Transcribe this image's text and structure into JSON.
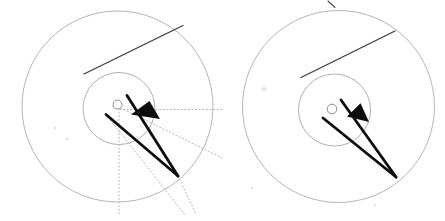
{
  "figure": {
    "width": 445,
    "height": 221,
    "background": "#ffffff",
    "colors": {
      "circle_stroke": "#b6b6b6",
      "inner_circle_stroke": "#b0b0b0",
      "hub_stroke": "#8f8f8f",
      "tangent_stroke": "#3c3c3c",
      "hand_stroke": "#0d0d0d",
      "arrowhead_fill": "#0d0d0d",
      "dotted_stroke": "#a9a9a9",
      "speck_color": "#c2c2c2",
      "tick_stroke": "#4a4a4a"
    },
    "stroke_widths": {
      "circle": 1,
      "inner_circle": 1,
      "hub": 1,
      "tangent": 1.3,
      "hand": 2.8,
      "dotted": 0.9,
      "tick": 1.1
    },
    "dotted_dash": "1 2.6",
    "panels": [
      {
        "name": "left-dial",
        "outer_circle": {
          "cx": 117.5,
          "cy": 106.5,
          "r": 95.5
        },
        "inner_circle": {
          "cx": 119,
          "cy": 108.5,
          "r": 36
        },
        "hub_circle": {
          "cx": 117.5,
          "cy": 104.5,
          "r": 4.5
        },
        "tangent_line": {
          "x1": 84,
          "y1": 74,
          "x2": 183,
          "y2": 25.5
        },
        "hands": [
          {
            "x1": 127,
            "y1": 95.5,
            "x2": 178,
            "y2": 176
          },
          {
            "x1": 106,
            "y1": 114.5,
            "x2": 178,
            "y2": 176
          }
        ],
        "arrowhead": [
          [
            131,
            114.5
          ],
          [
            149.5,
            101
          ],
          [
            160,
            119
          ]
        ],
        "dotted_lines": [
          {
            "x1": 120,
            "y1": 109.5,
            "x2": 223,
            "y2": 109.5
          },
          {
            "x1": 121,
            "y1": 108,
            "x2": 222,
            "y2": 158
          },
          {
            "x1": 119,
            "y1": 112,
            "x2": 119,
            "y2": 215
          },
          {
            "x1": 106,
            "y1": 114.5,
            "x2": 185,
            "y2": 215
          },
          {
            "x1": 178,
            "y1": 176,
            "x2": 196.5,
            "y2": 215
          }
        ],
        "specks": [
          {
            "x": 55,
            "y": 128,
            "type": "dot"
          },
          {
            "x": 67,
            "y": 139,
            "type": "dot"
          }
        ],
        "top_tick": null
      },
      {
        "name": "right-dial",
        "outer_circle": {
          "cx": 338.5,
          "cy": 106.5,
          "r": 96
        },
        "inner_circle": {
          "cx": 334.5,
          "cy": 110,
          "r": 36
        },
        "hub_circle": {
          "cx": 332,
          "cy": 109,
          "r": 4.8
        },
        "tangent_line": {
          "x1": 301,
          "y1": 77.5,
          "x2": 395,
          "y2": 31
        },
        "hands": [
          {
            "x1": 341,
            "y1": 100,
            "x2": 396,
            "y2": 177
          },
          {
            "x1": 323,
            "y1": 118,
            "x2": 396,
            "y2": 177
          }
        ],
        "arrowhead": [
          [
            347,
            116.5
          ],
          [
            360.5,
            103.3
          ],
          [
            369,
            122
          ]
        ],
        "dotted_lines": [],
        "specks": [
          {
            "x": 264,
            "y": 89,
            "type": "plus"
          },
          {
            "x": 252,
            "y": 188,
            "type": "dot"
          },
          {
            "x": 375,
            "y": 205,
            "type": "dot"
          }
        ],
        "top_tick": {
          "x1": 328,
          "y1": 1,
          "x2": 335,
          "y2": 7.5
        }
      }
    ]
  }
}
